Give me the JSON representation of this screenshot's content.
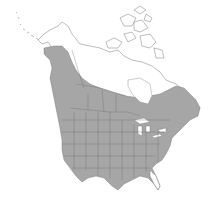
{
  "map": {
    "title": "Species range map of North America",
    "legend": [
      {
        "label": "Range",
        "color": "#a6a6a6"
      },
      {
        "label": "Outside range",
        "color": "#ffffff"
      }
    ],
    "colors": {
      "range_fill": "#a6a6a6",
      "land_fill": "#ffffff",
      "boundary_stroke": "#6e6e6e"
    },
    "regions_shaded": [
      "Contiguous United States (except southern Florida)",
      "Southern Canada",
      "Pacific coast of British Columbia",
      "Southeast Alaska coast",
      "Atlantic Canada"
    ],
    "regions_unshaded": [
      "Northern Alaska",
      "Northern Canada / Arctic Archipelago",
      "Southern Florida",
      "Great Lakes"
    ]
  }
}
